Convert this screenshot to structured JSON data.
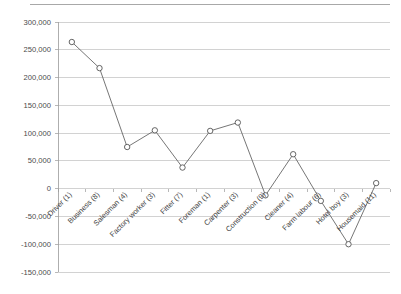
{
  "chart_data": {
    "type": "line",
    "title": "",
    "subtitle": "",
    "xlabel": "",
    "ylabel": "",
    "ylim": [
      -150000,
      300000
    ],
    "ytick_step": 50000,
    "grid": true,
    "legend": false,
    "legend_position": "none",
    "marker": "open-circle",
    "line_color": "#666666",
    "marker_fill": "#ffffff",
    "marker_stroke": "#555555",
    "gridline_color": "#bfbfbf",
    "xtick_rotation_degrees": 45,
    "categories": [
      "Driver (1)",
      "Business (8)",
      "Salesman (4)",
      "Factory worker (3)",
      "Fitter (7)",
      "Foreman (1)",
      "Carpenter (3)",
      "Construction (9)",
      "Cleaner (4)",
      "Farm labour (6)",
      "Hotel boy (3)",
      "Housemaid (11)"
    ],
    "values": [
      264000,
      217000,
      75000,
      105000,
      38000,
      104000,
      119000,
      -12000,
      62000,
      -22000,
      -100000,
      10000
    ],
    "ytick_labels": [
      "300,000",
      "250,000",
      "200,000",
      "150,000",
      "100,000",
      "50,000",
      "0",
      "-50,000",
      "-100,000",
      "-150,000"
    ],
    "ytick_values": [
      300000,
      250000,
      200000,
      150000,
      100000,
      50000,
      0,
      -50000,
      -100000,
      -150000
    ]
  }
}
